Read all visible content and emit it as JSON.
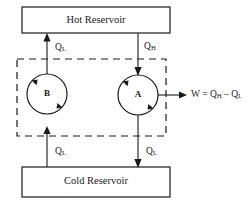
{
  "figure": {
    "type": "thermodynamics-carnot-engine-diagram",
    "background_color": "#ffffff",
    "line_color": "#1a1a1a"
  },
  "reservoirs": {
    "hot": {
      "label": "Hot Reservoir",
      "box": {
        "x": 22,
        "y": 7,
        "width": 148,
        "height": 26
      }
    },
    "cold": {
      "label": "Cold Reservoir",
      "box": {
        "x": 22,
        "y": 167,
        "width": 148,
        "height": 30
      }
    }
  },
  "enclosure": {
    "name": "dashed-system-boundary",
    "style": "dashed",
    "box": {
      "x": 17,
      "y": 59,
      "width": 149,
      "height": 77
    }
  },
  "engines": [
    {
      "id": "B",
      "label": "B",
      "role": "refrigerator",
      "cx": 47,
      "cy": 94,
      "r": 20,
      "cycle_direction": "counterclockwise"
    },
    {
      "id": "A",
      "label": "A",
      "role": "heat-engine",
      "cx": 138,
      "cy": 95,
      "r": 20,
      "cycle_direction": "counterclockwise"
    }
  ],
  "flows": [
    {
      "id": "b-top",
      "label": "Q",
      "subscript": "L",
      "direction": "up",
      "from": "engine-B",
      "to": "hot-reservoir",
      "label_x": 55,
      "label_y": 48
    },
    {
      "id": "a-top",
      "label": "Q",
      "subscript": "H",
      "direction": "down",
      "from": "hot-reservoir",
      "to": "engine-A",
      "label_x": 144,
      "label_y": 47
    },
    {
      "id": "b-bottom",
      "label": "Q",
      "subscript": "L",
      "direction": "up",
      "from": "cold-reservoir",
      "to": "engine-B",
      "label_x": 55,
      "label_y": 152
    },
    {
      "id": "a-bottom",
      "label": "Q",
      "subscript": "L",
      "direction": "down",
      "from": "engine-A",
      "to": "cold-reservoir",
      "label_x": 146,
      "label_y": 152
    }
  ],
  "work_output": {
    "name": "work-arrow",
    "equation_parts": {
      "w": "W",
      "equals": " = ",
      "q": "Q",
      "sub_h": "H",
      "minus": " – ",
      "q2": "Q",
      "sub_l": "L"
    },
    "full_text": "W = QH – QL",
    "label_x": 191,
    "label_y": 95
  }
}
